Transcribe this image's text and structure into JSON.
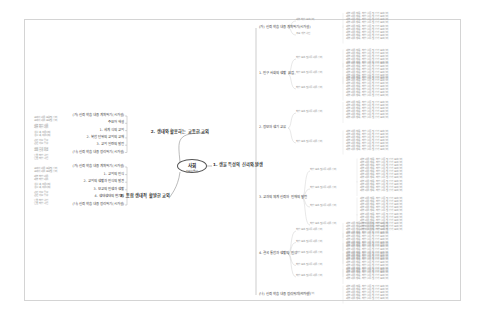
{
  "center": {
    "title": "사회",
    "subtitle": "신뢰성(중시)"
  },
  "left_branches": [
    {
      "label": "2. 생태와 활용하는 교통한 교외",
      "children": [
        "(가) 신뢰 학습 내용 계획하기(시가설)",
        "주요어 해설",
        "1. 세계 식의 교외",
        "2. 복합 단위의 교외의 교재",
        "3. 교외 일련의 발전",
        "(나) 신뢰 학습 내용 정리하기(시가설)"
      ],
      "notes": [
        "교과서 내용 요약 및 정리",
        "세부 학습 내용",
        "생활 속 적용 사례",
        "관련 자료 탐구",
        "교외 환경 비교",
        "단원 학습 확인"
      ]
    },
    {
      "label": "3. 통합 생태적 활발한 교외",
      "children": [
        "(가) 신뢰 학습 내용 계획하기(시가설)",
        "1. 교외의 인식",
        "2. 교외의 생활과 인식의 발견",
        "3. 보교의 인생과 생활",
        "4. 생태생태의 변기관",
        "(나) 신뢰 학습 내용 정리하기(시가설)"
      ],
      "notes": [
        "교과서 내용 요약 및 정리",
        "세부 학습 내용",
        "생활 속 적용 사례",
        "관련 자료 탐구",
        "단원 학습 확인"
      ]
    }
  ],
  "right_branch": {
    "label": "1. 생물 특성의 신뢰와 발생",
    "children": [
      {
        "label": "(가) 신뢰 학습 내용 계획하기(시가설)",
        "subs": [
          "세부 학습 요소 정리",
          "주요 개념 확인"
        ]
      },
      {
        "label": "1. 인구 사회의 생활 요점",
        "subs": [
          "학습 요소 및 활동 내용 정리",
          "학습 요소 및 활동 내용 정리",
          "학습 요소 및 활동 내용 정리"
        ]
      },
      {
        "label": "2. 정보와 생기 교류",
        "subs": [
          "학습 요소 및 활동 내용 정리",
          "학습 요소 및 활동 내용 정리"
        ]
      },
      {
        "label": "3. 교과의 체계 신뢰와 인재의 발전",
        "subs": [
          "학습 요소 및 활동 내용 정리",
          "학습 요소 및 활동 내용 정리",
          "학습 요소 및 활동 내용 정리",
          "학습 요소 및 활동 내용 정리"
        ]
      },
      {
        "label": "4. 결국 통합과 생활의 인식",
        "subs": [
          "학습 요소 및 활동 내용 정리",
          "학습 요소 및 활동 내용 정리",
          "학습 요소 및 활동 내용 정리",
          "학습 요소 및 활동 내용 정리",
          "학습 요소 및 활동 내용 정리"
        ]
      },
      {
        "label": "(나) 신뢰 학습 내용 정리하기(시가설)",
        "subs": [
          "단원 학습 내용 정리"
        ]
      }
    ],
    "detail_line": "세부 내용 항목 - 학습 활동 및 평가 요소 정리"
  }
}
